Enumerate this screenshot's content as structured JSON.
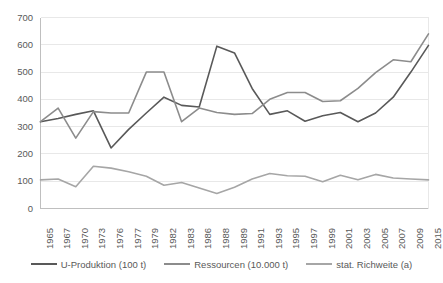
{
  "chart_data": {
    "type": "line",
    "title": "",
    "xlabel": "",
    "ylabel": "",
    "ylim": [
      0,
      700
    ],
    "ytick_step": 100,
    "grid": true,
    "legend_position": "bottom",
    "categories": [
      "1965",
      "1967",
      "1970",
      "1973",
      "1976",
      "1977",
      "1979",
      "1982",
      "1983",
      "1986",
      "1988",
      "1989",
      "1991",
      "1993",
      "1995",
      "1997",
      "1999",
      "2001",
      "2003",
      "2005",
      "2007",
      "2009",
      "2015"
    ],
    "yticks": [
      "0",
      "100",
      "200",
      "300",
      "400",
      "500",
      "600",
      "700"
    ],
    "series": [
      {
        "name": "U-Produktion (100 t)",
        "color": "#595959",
        "values": [
          318,
          330,
          345,
          358,
          222,
          290,
          350,
          408,
          378,
          372,
          595,
          570,
          440,
          345,
          358,
          320,
          340,
          352,
          318,
          350,
          408,
          500,
          598
        ]
      },
      {
        "name": "Ressourcen (10.000 t)",
        "color": "#8c8c8c",
        "values": [
          318,
          368,
          258,
          355,
          350,
          350,
          500,
          500,
          318,
          368,
          352,
          345,
          348,
          400,
          425,
          425,
          392,
          395,
          440,
          498,
          545,
          538,
          640
        ]
      },
      {
        "name": "stat. Richweite (a)",
        "color": "#a6a6a6",
        "values": [
          105,
          108,
          80,
          155,
          148,
          135,
          118,
          85,
          95,
          75,
          55,
          78,
          108,
          128,
          120,
          118,
          98,
          122,
          105,
          125,
          112,
          108,
          105
        ]
      }
    ]
  },
  "legend": {
    "items": [
      {
        "label": "U-Produktion (100 t)",
        "color": "#595959"
      },
      {
        "label": "Ressourcen (10.000 t)",
        "color": "#8c8c8c"
      },
      {
        "label": "stat. Richweite (a)",
        "color": "#a6a6a6"
      }
    ]
  },
  "colors": {
    "grid": "#e8e8e8",
    "axis": "#bfbfbf",
    "text": "#595959",
    "background": "#ffffff"
  }
}
